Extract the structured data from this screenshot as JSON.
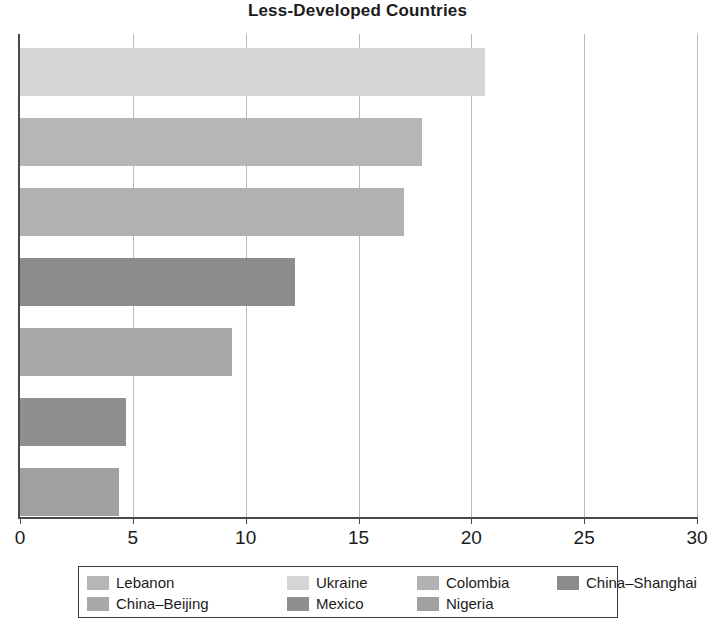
{
  "chart_data": {
    "type": "bar",
    "orientation": "horizontal",
    "title": "Less-Developed Countries",
    "xlabel": "",
    "ylabel": "",
    "xlim": [
      0,
      30
    ],
    "xticks": [
      0,
      5,
      10,
      15,
      20,
      25,
      30
    ],
    "xtick_labels": [
      "0",
      "5",
      "10",
      "15",
      "20",
      "25",
      "30"
    ],
    "grid": true,
    "grid_axis": "x",
    "legend_position": "bottom",
    "categories": [
      "Ukraine",
      "Lebanon",
      "Colombia",
      "China–Shanghai",
      "China–Beijing",
      "Mexico",
      "Nigeria"
    ],
    "values": [
      20.6,
      17.8,
      17.0,
      12.2,
      9.4,
      4.7,
      4.4
    ],
    "colors": [
      "#d5d5d5",
      "#b6b6b6",
      "#b2b2b2",
      "#8c8c8c",
      "#a9a9a9",
      "#8f8f8f",
      "#a0a0a0"
    ],
    "series": [
      {
        "name": "Less-Developed Countries",
        "points": [
          {
            "label": "Ukraine",
            "value": 20.6,
            "color": "#d5d5d5"
          },
          {
            "label": "Lebanon",
            "value": 17.8,
            "color": "#b6b6b6"
          },
          {
            "label": "Colombia",
            "value": 17.0,
            "color": "#b2b2b2"
          },
          {
            "label": "China–Shanghai",
            "value": 12.2,
            "color": "#8c8c8c"
          },
          {
            "label": "China–Beijing",
            "value": 9.4,
            "color": "#a9a9a9"
          },
          {
            "label": "Mexico",
            "value": 4.7,
            "color": "#8f8f8f"
          },
          {
            "label": "Nigeria",
            "value": 4.4,
            "color": "#a0a0a0"
          }
        ]
      }
    ]
  },
  "legend": {
    "rows": [
      [
        {
          "label": "Lebanon",
          "color": "#b6b6b6"
        },
        {
          "label": "Ukraine",
          "color": "#d5d5d5"
        },
        {
          "label": "Colombia",
          "color": "#b2b2b2"
        },
        {
          "label": "China–Shanghai",
          "color": "#8c8c8c"
        }
      ],
      [
        {
          "label": "China–Beijing",
          "color": "#a9a9a9"
        },
        {
          "label": "Mexico",
          "color": "#8f8f8f"
        },
        {
          "label": "Nigeria",
          "color": "#a0a0a0"
        }
      ]
    ]
  }
}
